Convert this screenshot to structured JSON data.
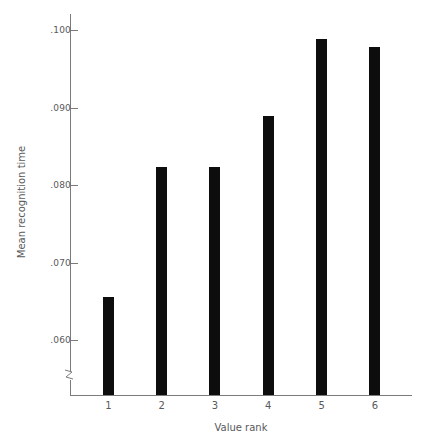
{
  "chart_data": {
    "type": "bar",
    "title": "",
    "xlabel": "Value rank",
    "ylabel": "Mean recognition time",
    "categories": [
      "1",
      "2",
      "3",
      "4",
      "5",
      "6"
    ],
    "values": [
      0.0655,
      0.0823,
      0.0823,
      0.0889,
      0.0988,
      0.0978
    ],
    "ytick_labels": [
      ".060",
      ".070",
      ".080",
      ".090",
      ".100"
    ],
    "ytick_values": [
      0.06,
      0.07,
      0.08,
      0.09,
      0.1
    ],
    "ylim": [
      0.0555,
      0.1025
    ],
    "axis_break": true,
    "grid": false,
    "legend": "none",
    "bar_color": "#0d0d0d",
    "axis_color": "#7b7b7b",
    "text_color": "#58595b"
  },
  "axes": {
    "x_title": "Value rank",
    "y_title": "Mean recognition time"
  }
}
